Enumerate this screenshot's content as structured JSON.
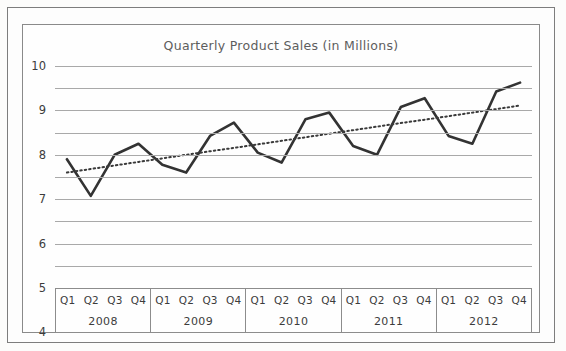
{
  "chart_data": {
    "type": "line",
    "title": "Quarterly Product Sales (in Millions)",
    "xlabel": "",
    "ylabel": "",
    "ylim": [
      0,
      10
    ],
    "yticks": [
      10,
      9,
      8,
      7,
      6,
      5,
      4,
      3,
      2,
      1,
      0
    ],
    "grid": true,
    "legend": "none",
    "categories": [
      "Q1 2008",
      "Q2 2008",
      "Q3 2008",
      "Q4 2008",
      "Q1 2009",
      "Q2 2009",
      "Q3 2009",
      "Q4 2009",
      "Q1 2010",
      "Q2 2010",
      "Q3 2010",
      "Q4 2010",
      "Q1 2011",
      "Q2 2011",
      "Q3 2011",
      "Q4 2011",
      "Q1 2012",
      "Q2 2012",
      "Q3 2012",
      "Q4 2012"
    ],
    "series": [
      {
        "name": "Quarterly Sales",
        "style": "solid",
        "color": "#333333",
        "values": [
          5.8,
          4.15,
          6.0,
          6.5,
          5.55,
          5.2,
          6.85,
          7.45,
          6.1,
          5.65,
          7.6,
          7.9,
          6.4,
          6.0,
          8.15,
          8.55,
          6.85,
          6.5,
          8.85,
          9.25
        ]
      },
      {
        "name": "Trendline",
        "style": "dotted",
        "color": "#3a3a3a",
        "values": [
          5.2,
          5.36,
          5.52,
          5.68,
          5.84,
          6.0,
          6.16,
          6.31,
          6.47,
          6.63,
          6.79,
          6.95,
          7.11,
          7.27,
          7.43,
          7.58,
          7.74,
          7.9,
          8.06,
          8.22
        ]
      }
    ],
    "years": [
      {
        "year": "2008",
        "quarters": [
          "Q1",
          "Q2",
          "Q3",
          "Q4"
        ]
      },
      {
        "year": "2009",
        "quarters": [
          "Q1",
          "Q2",
          "Q3",
          "Q4"
        ]
      },
      {
        "year": "2010",
        "quarters": [
          "Q1",
          "Q2",
          "Q3",
          "Q4"
        ]
      },
      {
        "year": "2011",
        "quarters": [
          "Q1",
          "Q2",
          "Q3",
          "Q4"
        ]
      },
      {
        "year": "2012",
        "quarters": [
          "Q1",
          "Q2",
          "Q3",
          "Q4"
        ]
      }
    ],
    "colors": {
      "gridline": "#a9a9a9",
      "series": "#333333",
      "trendline": "#3a3a3a",
      "frame": "#7d7d7d",
      "title_text": "#5d5d5d",
      "axis_text": "#3c3c3c"
    }
  }
}
